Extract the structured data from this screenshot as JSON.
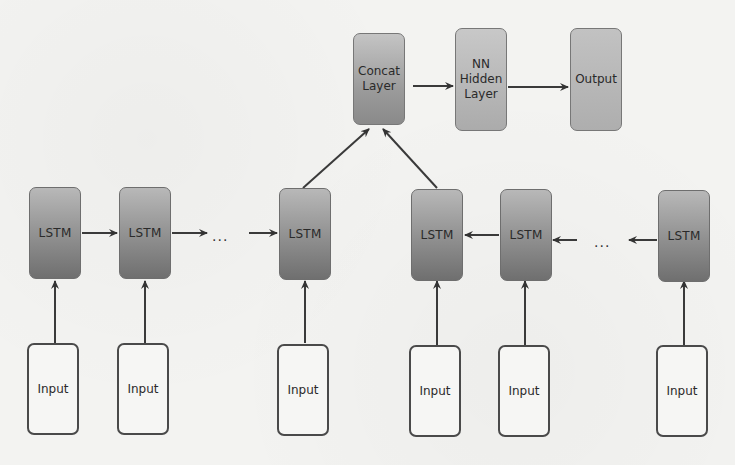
{
  "diagram": {
    "type": "bidirectional-lstm-architecture",
    "top_layers": [
      {
        "id": "concat",
        "label": "Concat Layer",
        "lines": [
          "Concat",
          "Layer"
        ]
      },
      {
        "id": "hidden",
        "label": "NN Hidden Layer",
        "lines": [
          "NN",
          "Hidden",
          "Layer"
        ]
      },
      {
        "id": "output",
        "label": "Output",
        "lines": [
          "Output"
        ]
      }
    ],
    "forward_chain": {
      "direction": "left-to-right",
      "cells": [
        {
          "label": "LSTM"
        },
        {
          "label": "LSTM"
        },
        {
          "label": "LSTM"
        }
      ],
      "ellipsis": "..."
    },
    "backward_chain": {
      "direction": "right-to-left",
      "cells": [
        {
          "label": "LSTM"
        },
        {
          "label": "LSTM"
        },
        {
          "label": "LSTM"
        }
      ],
      "ellipsis": "..."
    },
    "inputs": [
      {
        "label": "Input"
      },
      {
        "label": "Input"
      },
      {
        "label": "Input"
      },
      {
        "label": "Input"
      },
      {
        "label": "Input"
      },
      {
        "label": "Input"
      }
    ],
    "edges": [
      "Input -> LSTM (each column)",
      "forward LSTM 1 -> LSTM 2 -> ... -> LSTM 3",
      "backward LSTM 6 -> ... -> LSTM 5 -> LSTM 4",
      "forward LSTM 3 -> Concat Layer",
      "backward LSTM 4 -> Concat Layer",
      "Concat Layer -> NN Hidden Layer",
      "NN Hidden Layer -> Output"
    ],
    "colors": {
      "lstm_fill_top": "#b8b8b8",
      "lstm_fill_bottom": "#6f6f6f",
      "input_fill": "#f6f6f4",
      "edge": "#3a3a3a",
      "background": "#f3f3f1"
    }
  }
}
